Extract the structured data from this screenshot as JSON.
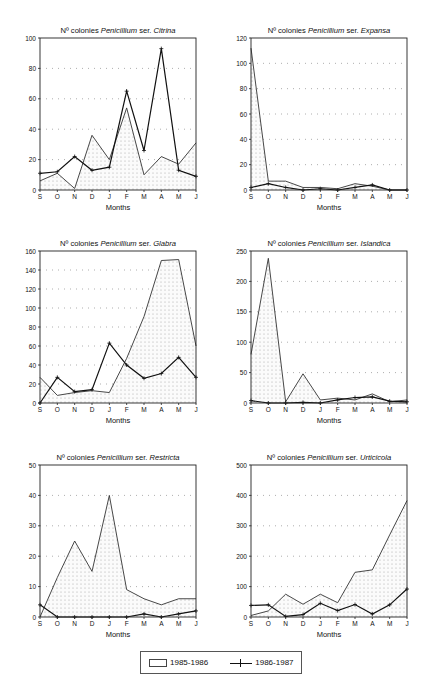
{
  "legend": {
    "series_a": "1985-1986",
    "series_b": "1986-1987"
  },
  "chart_data": [
    {
      "type": "line",
      "title": "Nº colonies Penicillium ser. Citrina",
      "title_prefix": "Nº colonies ",
      "title_genus": "Penicillium",
      "title_mid": " ser. ",
      "title_series": "Citrina",
      "xlabel": "Months",
      "ylabel": "",
      "categories": [
        "S",
        "O",
        "N",
        "D",
        "J",
        "F",
        "M",
        "A",
        "M",
        "J"
      ],
      "ylim": [
        0,
        100
      ],
      "yticks": [
        0,
        20,
        40,
        60,
        80,
        100
      ],
      "grid": "horizontal dotted",
      "series": [
        {
          "name": "1985-1986",
          "style": "shaded area",
          "values": [
            6,
            11,
            1,
            36,
            20,
            54,
            10,
            22,
            17,
            31
          ]
        },
        {
          "name": "1986-1987",
          "style": "line with + markers",
          "values": [
            11,
            12,
            22,
            13,
            15,
            65,
            26,
            93,
            13,
            9
          ]
        }
      ]
    },
    {
      "type": "line",
      "title": "Nº colonies Penicillium ser. Expansa",
      "title_prefix": "Nº colonies ",
      "title_genus": "Penicillium",
      "title_mid": " ser. ",
      "title_series": "Expansa",
      "xlabel": "Months",
      "ylabel": "",
      "categories": [
        "S",
        "O",
        "N",
        "D",
        "J",
        "F",
        "M",
        "A",
        "M",
        "J"
      ],
      "ylim": [
        0,
        120
      ],
      "yticks": [
        0,
        20,
        40,
        60,
        80,
        100,
        120
      ],
      "grid": "horizontal dotted",
      "series": [
        {
          "name": "1985-1986",
          "style": "shaded area",
          "values": [
            112,
            7,
            7,
            2,
            2,
            1,
            5,
            3,
            0,
            0
          ]
        },
        {
          "name": "1986-1987",
          "style": "line with + markers",
          "values": [
            2,
            5,
            2,
            0,
            1,
            0,
            2,
            4,
            0,
            0
          ]
        }
      ]
    },
    {
      "type": "line",
      "title": "Nº colonies Penicillium ser. Glabra",
      "title_prefix": "Nº colonies ",
      "title_genus": "Penicillium",
      "title_mid": " ser. ",
      "title_series": "Glabra",
      "xlabel": "Months",
      "ylabel": "",
      "categories": [
        "S",
        "O",
        "N",
        "D",
        "J",
        "F",
        "M",
        "A",
        "M",
        "J"
      ],
      "ylim": [
        0,
        160
      ],
      "yticks": [
        0,
        20,
        40,
        60,
        80,
        100,
        120,
        140,
        160
      ],
      "grid": "horizontal dotted",
      "series": [
        {
          "name": "1985-1986",
          "style": "shaded area",
          "values": [
            27,
            8,
            11,
            13,
            11,
            47,
            91,
            150,
            151,
            60
          ]
        },
        {
          "name": "1986-1987",
          "style": "line with + markers",
          "values": [
            0,
            27,
            12,
            14,
            63,
            40,
            26,
            31,
            48,
            27
          ]
        }
      ]
    },
    {
      "type": "line",
      "title": "Nº colonies Penicillium ser. Islandica",
      "title_prefix": "Nº colonies ",
      "title_genus": "Penicillium",
      "title_mid": " ser. ",
      "title_series": "Islandica",
      "xlabel": "Months",
      "ylabel": "",
      "categories": [
        "S",
        "O",
        "N",
        "D",
        "J",
        "F",
        "M",
        "A",
        "M",
        "J"
      ],
      "ylim": [
        0,
        250
      ],
      "yticks": [
        0,
        50,
        100,
        150,
        200,
        250
      ],
      "grid": "horizontal dotted",
      "series": [
        {
          "name": "1985-1986",
          "style": "shaded area",
          "values": [
            80,
            238,
            2,
            48,
            5,
            8,
            5,
            15,
            2,
            5
          ]
        },
        {
          "name": "1986-1987",
          "style": "line with + markers",
          "values": [
            4,
            0,
            0,
            1,
            0,
            5,
            9,
            10,
            3,
            2
          ]
        }
      ]
    },
    {
      "type": "line",
      "title": "Nº colonies Penicillium ser. Restricta",
      "title_prefix": "Nº colonies ",
      "title_genus": "Penicillium",
      "title_mid": " ser. ",
      "title_series": "Restricta",
      "xlabel": "Months",
      "ylabel": "",
      "categories": [
        "S",
        "O",
        "N",
        "D",
        "J",
        "F",
        "M",
        "A",
        "M",
        "J"
      ],
      "ylim": [
        0,
        50
      ],
      "yticks": [
        0,
        10,
        20,
        30,
        40,
        50
      ],
      "grid": "horizontal dotted",
      "series": [
        {
          "name": "1985-1986",
          "style": "shaded area",
          "values": [
            0,
            13,
            25,
            15,
            40,
            9,
            6,
            4,
            6,
            6
          ]
        },
        {
          "name": "1986-1987",
          "style": "line with + markers",
          "values": [
            4,
            0,
            0,
            0,
            0,
            0,
            1,
            0,
            1,
            2
          ]
        }
      ]
    },
    {
      "type": "line",
      "title": "Nº colonies Penicillium ser. Urticicola",
      "title_prefix": "Nº colonies ",
      "title_genus": "Penicillium",
      "title_mid": " ser. ",
      "title_series": "Urticicola",
      "xlabel": "Months",
      "ylabel": "",
      "categories": [
        "S",
        "O",
        "N",
        "D",
        "J",
        "F",
        "M",
        "A",
        "M",
        "J"
      ],
      "ylim": [
        0,
        500
      ],
      "yticks": [
        0,
        100,
        200,
        300,
        400,
        500
      ],
      "grid": "horizontal dotted",
      "series": [
        {
          "name": "1985-1986",
          "style": "shaded area",
          "values": [
            5,
            20,
            75,
            42,
            75,
            47,
            147,
            155,
            270,
            383
          ]
        },
        {
          "name": "1986-1987",
          "style": "line with + markers",
          "values": [
            38,
            40,
            2,
            8,
            45,
            21,
            41,
            10,
            40,
            92
          ]
        }
      ]
    }
  ]
}
